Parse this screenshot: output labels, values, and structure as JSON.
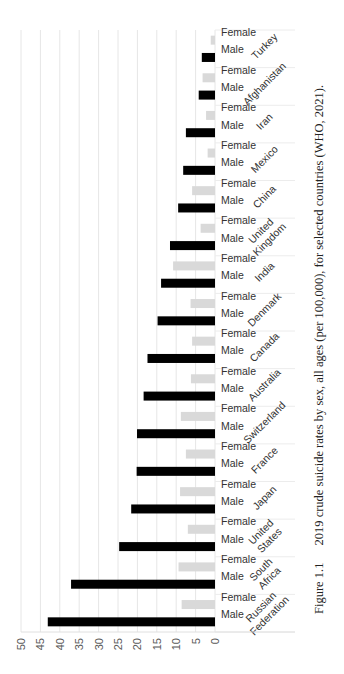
{
  "chart_data": {
    "type": "bar",
    "orientation": "vertical bars, whole figure rotated 90° counter-clockwise on the page",
    "title": "",
    "xlabel": "",
    "ylabel": "",
    "ylim": [
      0,
      50
    ],
    "yticks": [
      0,
      5,
      10,
      15,
      20,
      25,
      30,
      35,
      40,
      45,
      50
    ],
    "grid": true,
    "legend": "none (sex shown as per-bar category labels)",
    "categories": [
      "Russian Federation",
      "South Africa",
      "United States",
      "Japan",
      "France",
      "Switzerland",
      "Australia",
      "Canada",
      "Denmark",
      "India",
      "United Kingdom",
      "China",
      "Mexico",
      "Iran",
      "Afghanistan",
      "Turkey"
    ],
    "sub_categories": [
      "Male",
      "Female"
    ],
    "series": [
      {
        "name": "Male",
        "color": "#000000",
        "values": [
          43.1,
          37.1,
          24.7,
          21.6,
          20.2,
          20.1,
          18.4,
          17.4,
          14.8,
          13.9,
          11.6,
          9.5,
          8.2,
          7.5,
          4.2,
          3.4
        ]
      },
      {
        "name": "Female",
        "color": "#d9d9d9",
        "values": [
          8.6,
          9.4,
          7.0,
          9.0,
          7.5,
          8.8,
          6.2,
          5.9,
          6.3,
          10.8,
          3.7,
          5.9,
          1.9,
          2.3,
          3.2,
          1.1
        ]
      }
    ]
  },
  "labels": {
    "male": "Male",
    "female": "Female",
    "countries": [
      [
        "Russian",
        "Federation"
      ],
      [
        "South",
        "Africa"
      ],
      [
        "United",
        "States"
      ],
      [
        "Japan"
      ],
      [
        "France"
      ],
      [
        "Switzerland"
      ],
      [
        "Australia"
      ],
      [
        "Canada"
      ],
      [
        "Denmark"
      ],
      [
        "India"
      ],
      [
        "United",
        "Kingdom"
      ],
      [
        "China"
      ],
      [
        "Mexico"
      ],
      [
        "Iran"
      ],
      [
        "Afghanistan"
      ],
      [
        "Turkey"
      ]
    ]
  },
  "caption": {
    "figure": "Figure 1.1",
    "text": "2019 crude suicide rates by sex, all ages (per 100,000), for selected countries (WHO, 2021)."
  },
  "colors": {
    "male": "#000000",
    "female": "#d9d9d9",
    "grid": "#e6e6e6",
    "axis_text": "#595959"
  }
}
